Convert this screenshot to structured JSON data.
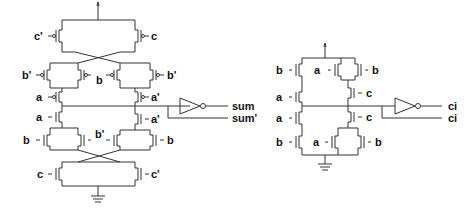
{
  "sum_circuit": {
    "labels": {
      "c_prime_top": "c'",
      "c_top": "c",
      "b_prime_left": "b'",
      "b_mid": "b",
      "b_prime_right": "b'",
      "a_left_top": "a",
      "a_prime_right_top": "a'",
      "a_left_bot": "a",
      "a_prime_right_bot": "a'",
      "b_left_bot": "b",
      "b_prime_mid_bot": "b'",
      "b_right_bot": "b",
      "c_bot": "c",
      "c_prime_bot": "c'"
    },
    "outputs": {
      "sum": "sum",
      "sum_prime": "sum'"
    }
  },
  "carry_circuit": {
    "labels": {
      "b_top_left": "b",
      "a_top_mid": "a",
      "b_top_right": "b",
      "a_left": "a",
      "c_right": "c",
      "a_bot_left": "a",
      "c_bot_right": "c",
      "b_bot_left": "b",
      "a_bot_mid": "a",
      "b_bot_right": "b"
    },
    "outputs": {
      "ci": "ci",
      "ci_prime": "ci"
    }
  }
}
